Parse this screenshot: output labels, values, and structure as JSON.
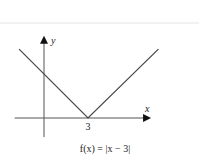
{
  "chart_data": {
    "type": "line",
    "title": "",
    "caption": "f(x) = |x − 3|",
    "xlabel": "x",
    "ylabel": "y",
    "xlim": [
      -2,
      7.3
    ],
    "ylim": [
      -1.3,
      5.6
    ],
    "grid": false,
    "ticks": {
      "x": [
        {
          "value": 3,
          "label": "3"
        }
      ]
    },
    "series": [
      {
        "name": "f(x) = |x − 3|",
        "points": [
          [
            -1.7,
            4.7
          ],
          [
            3,
            0
          ],
          [
            7.8,
            4.7
          ]
        ]
      }
    ]
  }
}
